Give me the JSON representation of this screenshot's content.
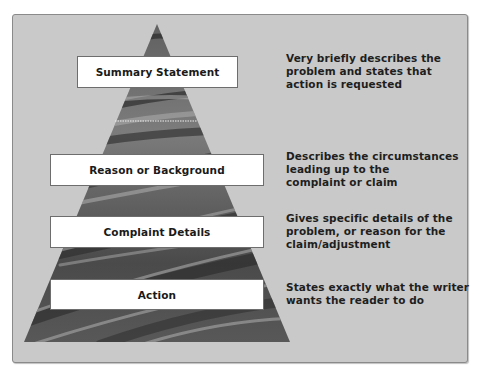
{
  "diagram": {
    "type": "pyramid",
    "colors": {
      "panel_background": "#c9c9c9",
      "panel_border": "#8a8a8a",
      "box_fill": "#ffffff",
      "text": "#1e1e1e",
      "pyramid_texture_dark": "#3a3a3a",
      "pyramid_texture_light": "#9a9a9a"
    },
    "levels": [
      {
        "label": "Summary Statement",
        "description_lines": [
          "Very briefly describes the",
          "problem and states that",
          "action is requested"
        ]
      },
      {
        "label": "Reason or Background",
        "description_lines": [
          "Describes the circumstances",
          "leading up to the",
          "complaint or claim"
        ]
      },
      {
        "label": "Complaint Details",
        "description_lines": [
          "Gives specific details of the",
          "problem, or reason for the",
          "claim/adjustment"
        ]
      },
      {
        "label": "Action",
        "description_lines": [
          "States exactly what the writer",
          "wants the reader to do"
        ]
      }
    ]
  }
}
